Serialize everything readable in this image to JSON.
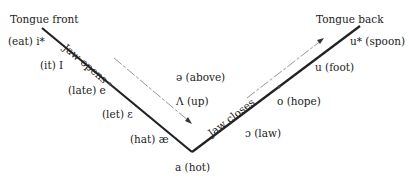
{
  "diagram": {
    "title_left": "Tongue front",
    "title_right": "Tongue back",
    "arrow_left_label": "Jaw opens",
    "arrow_right_label": "Jaw closes",
    "front_vowels": [
      {
        "symbol": "i*",
        "word": "eat",
        "text": "(eat) i*"
      },
      {
        "symbol": "I",
        "word": "it",
        "text": "(it) I"
      },
      {
        "symbol": "e",
        "word": "late",
        "text": "(late) e"
      },
      {
        "symbol": "ɛ",
        "word": "let",
        "text": "(let) ɛ"
      },
      {
        "symbol": "æ",
        "word": "hat",
        "text": "(hat) æ"
      }
    ],
    "bottom_vowel": {
      "symbol": "a",
      "word": "hot",
      "text": "a (hot)"
    },
    "central_vowels": [
      {
        "symbol": "ə",
        "word": "above",
        "text": "ə (above)"
      },
      {
        "symbol": "Λ",
        "word": "up",
        "text": "Λ (up)"
      }
    ],
    "back_vowels": [
      {
        "symbol": "u*",
        "word": "spoon",
        "text": "u* (spoon)"
      },
      {
        "symbol": "u",
        "word": "foot",
        "text": "u (foot)"
      },
      {
        "symbol": "o",
        "word": "hope",
        "text": "o (hope)"
      },
      {
        "symbol": "ɔ",
        "word": "law",
        "text": "ɔ (law)"
      }
    ]
  }
}
